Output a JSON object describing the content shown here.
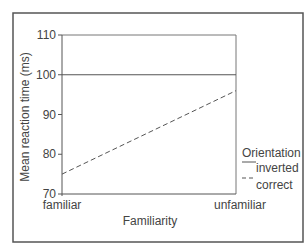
{
  "chart_data": {
    "type": "line",
    "title": "",
    "xlabel": "Familiarity",
    "ylabel": "Mean reaction time (ms)",
    "categories": [
      "familiar",
      "unfamiliar"
    ],
    "series": [
      {
        "name": "inverted",
        "style": "solid",
        "values": [
          100,
          100
        ]
      },
      {
        "name": "correct",
        "style": "dashed",
        "values": [
          75,
          96
        ]
      }
    ],
    "ylim": [
      70,
      110
    ],
    "yticks": [
      70,
      80,
      90,
      100,
      110
    ],
    "grid": false,
    "legend": {
      "title": "Orientation",
      "position": "right",
      "entries": [
        "inverted",
        "correct"
      ]
    }
  }
}
